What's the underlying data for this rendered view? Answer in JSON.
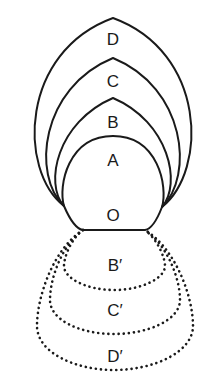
{
  "figure": {
    "background_color": "#ffffff",
    "stroke_color": "#1a1a1a",
    "nodes": {
      "left_junction": {
        "x": 64,
        "y": 206
      },
      "right_junction": {
        "x": 162,
        "y": 207
      },
      "chord_left": {
        "x": 83,
        "y": 230
      },
      "chord_right": {
        "x": 145,
        "y": 230
      }
    },
    "solid_curves": [
      {
        "id": "curve-a",
        "label": "A",
        "label_x": 113,
        "label_y": 166,
        "apex_y": 136,
        "left_x": 78,
        "right_x": 150,
        "style": "solid"
      },
      {
        "id": "curve-b",
        "label": "B",
        "label_x": 113,
        "label_y": 128,
        "apex_y": 98,
        "left_x": 57,
        "right_x": 169,
        "style": "solid"
      },
      {
        "id": "curve-c",
        "label": "C",
        "label_x": 113,
        "label_y": 87,
        "apex_y": 58,
        "left_x": 40,
        "right_x": 187,
        "style": "solid"
      },
      {
        "id": "curve-d",
        "label": "D",
        "label_x": 113,
        "label_y": 45,
        "apex_y": 18,
        "left_x": 20,
        "right_x": 207,
        "style": "solid"
      }
    ],
    "dotted_curves": [
      {
        "id": "curve-b-prime",
        "label": "B′",
        "label_x": 115,
        "label_y": 271,
        "nadir_y": 281,
        "left_x": 64,
        "right_x": 165,
        "style": "dotted"
      },
      {
        "id": "curve-c-prime",
        "label": "C′",
        "label_x": 115,
        "label_y": 316,
        "nadir_y": 325,
        "left_x": 50,
        "right_x": 180,
        "style": "dotted"
      },
      {
        "id": "curve-d-prime",
        "label": "D′",
        "label_x": 115,
        "label_y": 362,
        "nadir_y": 371,
        "left_x": 37,
        "right_x": 193,
        "style": "dotted"
      }
    ],
    "point_label": {
      "id": "point-o",
      "label": "O",
      "label_x": 113,
      "label_y": 221
    }
  }
}
